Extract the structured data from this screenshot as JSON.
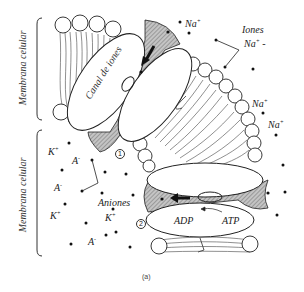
{
  "figure": {
    "caption": "(a)",
    "membrane_labels": {
      "upper": "Membrana celular",
      "lower": "Membrana celular"
    },
    "ion_channel": {
      "label": "Canal de iones",
      "marker": "1"
    },
    "pump": {
      "marker": "2",
      "adp_label": "ADP",
      "atp_label": "ATP"
    },
    "extracellular": {
      "na_labels": [
        {
          "base": "Na",
          "sup": "+"
        },
        {
          "base": "Na",
          "sup": "+"
        },
        {
          "base": "Na",
          "sup": "+"
        }
      ],
      "ions_group": {
        "title": "Iones",
        "base": "Na",
        "sup": "+",
        "suffix": " -"
      }
    },
    "intracellular": {
      "k_labels": [
        {
          "base": "K",
          "sup": "+"
        },
        {
          "base": "K",
          "sup": "+"
        },
        {
          "base": "K",
          "sup": "+"
        }
      ],
      "a_labels": [
        {
          "base": "A",
          "sup": "-"
        },
        {
          "base": "A",
          "sup": "-"
        },
        {
          "base": "A",
          "sup": "-"
        }
      ],
      "anions_label": "Aniones"
    }
  },
  "colors": {
    "line": "#222222",
    "shade": "#9a9a9a",
    "fill": "#ffffff",
    "background": "#ffffff"
  }
}
